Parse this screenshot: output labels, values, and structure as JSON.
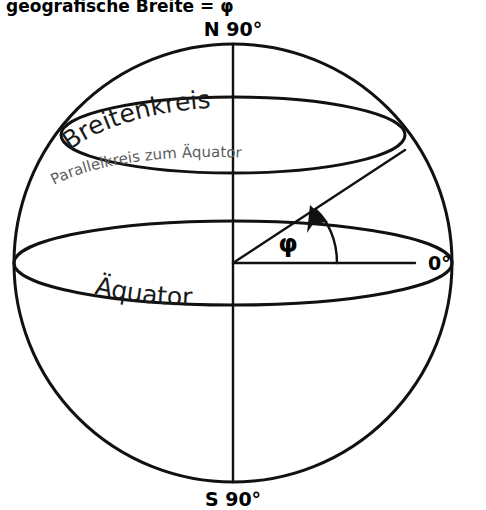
{
  "diagram": {
    "title": "geografische Breite = φ",
    "background_color": "#ffffff",
    "line_color": "#111111",
    "labels": {
      "north_pole": "N 90°",
      "south_pole": "S 90°",
      "equator_degree": "0°",
      "latitude_circle": "Breitenkreis",
      "latitude_circle_subtitle": "Parallelkreis zum Äquator",
      "equator": "Äquator",
      "angle_symbol": "φ"
    },
    "label_colors": {
      "latitude_circle": "#1b1b1b",
      "latitude_circle_subtitle": "#5e5e5e",
      "equator": "#1b1b1b",
      "pole_labels": "#000000"
    },
    "geometry": {
      "sphere_center_x": 233,
      "sphere_center_y": 263,
      "sphere_radius": 219,
      "equator_semi_minor": 42,
      "latitude_circle_center_y": 135,
      "latitude_circle_semi_major": 172,
      "latitude_circle_semi_minor": 38,
      "angle_phi_degrees": 36,
      "radius_endpoint_x": 405,
      "radius_endpoint_y": 150,
      "arrow_tip_x": 310,
      "arrow_tip_y": 207
    }
  }
}
